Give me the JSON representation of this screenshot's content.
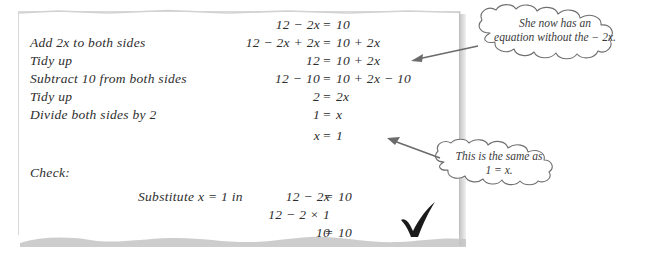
{
  "worksheet": {
    "steps": [
      "Add 2x to both sides",
      "Tidy up",
      "Subtract 10 from both sides",
      "Tidy up",
      "Divide both sides by 2"
    ],
    "equations": [
      {
        "lhs": "12 − 2x",
        "sign": "=",
        "rhs": "10"
      },
      {
        "lhs": "12 − 2x + 2x",
        "sign": "=",
        "rhs": "10 + 2x"
      },
      {
        "lhs": "12",
        "sign": "=",
        "rhs": "10 + 2x"
      },
      {
        "lhs": "12 − 10",
        "sign": "=",
        "rhs": "10 + 2x − 10"
      },
      {
        "lhs": "2",
        "sign": "=",
        "rhs": "2x"
      },
      {
        "lhs": "1",
        "sign": "=",
        "rhs": "x"
      },
      {
        "lhs": "x",
        "sign": "=",
        "rhs": "1"
      }
    ],
    "check": {
      "label": "Check:",
      "substitute_label": "Substitute x = 1 in",
      "lines": [
        {
          "lhs": "12 − 2x",
          "sign": "=",
          "rhs": "10"
        },
        {
          "lhs": "12 − 2 × 1",
          "sign": "",
          "rhs": ""
        },
        {
          "lhs": "10",
          "sign": "=",
          "rhs": "10"
        }
      ],
      "tick_icon": "check-mark-icon"
    },
    "callouts": [
      {
        "name": "callout-top",
        "line1": "She now has an",
        "line2": "equation without the − 2x."
      },
      {
        "name": "callout-bottom",
        "line1": "This is the same as",
        "line2": "1 = x."
      }
    ],
    "colors": {
      "ink": "#2e2e2e",
      "callout_ink": "#3a3a3a",
      "callout_outline": "#6f6f6f",
      "paper_edge": "#c9c9c9",
      "paper_shadow": "#bdbdbd",
      "background": "#ffffff"
    }
  }
}
